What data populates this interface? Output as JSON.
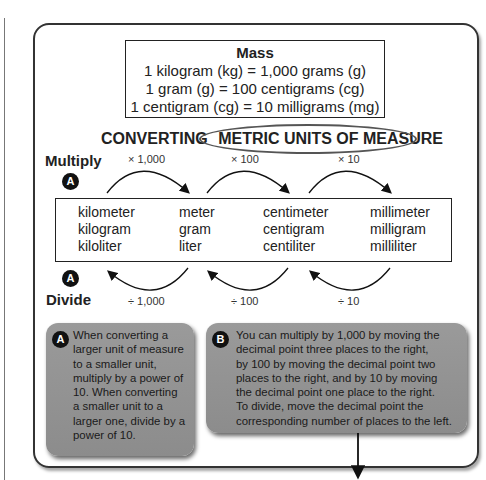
{
  "mass_box": {
    "title": "Mass",
    "lines": [
      "1 kilogram (kg) = 1,000 grams (g)",
      "1 gram (g) = 100 centigrams (cg)",
      "1 centigram (cg) = 10 milligrams (mg)"
    ]
  },
  "heading": {
    "prefix": "CONVERTING",
    "circled": "METRIC UNITS OF MEASURE"
  },
  "multiply": {
    "label": "Multiply",
    "badge": "A",
    "factors": [
      "× 1,000",
      "× 100",
      "× 10"
    ]
  },
  "divide": {
    "label": "Divide",
    "badge": "A",
    "factors": [
      "÷ 1,000",
      "÷ 100",
      "÷ 10"
    ]
  },
  "units": {
    "columns": [
      [
        "kilometer",
        "kilogram",
        "kiloliter"
      ],
      [
        "meter",
        "gram",
        "liter"
      ],
      [
        "centimeter",
        "centigram",
        "centiliter"
      ],
      [
        "millimeter",
        "milligram",
        "milliliter"
      ]
    ]
  },
  "callouts": [
    {
      "badge": "A",
      "text": "When converting a\nlarger unit of measure\nto a smaller unit,\nmultiply by a power of\n10. When converting\na smaller unit to a\nlarger one, divide by a\npower of 10."
    },
    {
      "badge": "B",
      "text": "You can multiply by 1,000 by moving the\ndecimal point three places to the right,\nby 100 by moving the decimal point two\nplaces to the right, and by 10 by moving\nthe decimal point one place to the right.\nTo divide, move the decimal point the\ncorresponding number of places to the left."
    }
  ],
  "colors": {
    "callout_bg": "#959595",
    "badge_bg": "#111111",
    "frame": "#333333"
  }
}
